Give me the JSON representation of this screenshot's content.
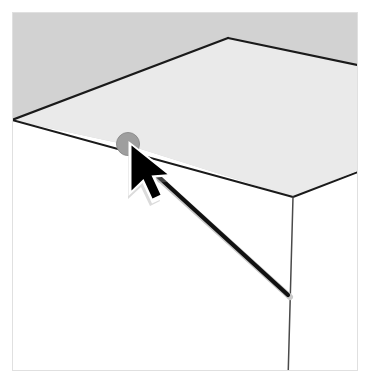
{
  "caption": {
    "text": "the second line",
    "note": "clipped at top edge of image"
  },
  "canvas": {
    "width": 370,
    "height": 383,
    "background": "#ffffff",
    "border_color": "#e3e3e3",
    "border_inset": 12
  },
  "palette": {
    "background_gray": "#d2d2d2",
    "plane_light": "#e9e9e9",
    "line_dark": "#1a1a1a",
    "marker_gray": "#9e9e9e",
    "marker_gray_dark": "#8a8a8a",
    "cursor_black": "#000000",
    "cursor_outline": "#ffffff",
    "cursor_shadow": "#bdbdbd",
    "thin_line": "#3c3c3c"
  },
  "geometry": {
    "background_band": {
      "label": "upper gray background band",
      "points": "12,20 358,20 358,170 293,197 128,145 12,120"
    },
    "ceiling_plane": {
      "label": "ceiling plane",
      "points": "12,120 228,38 358,65 358,170 293,197 128,145"
    },
    "ridge_apex": {
      "x": 228,
      "y": 38
    },
    "ridge_left_end": {
      "x": 12,
      "y": 120
    },
    "ridge_right_end": {
      "x": 358,
      "y": 65
    },
    "corner_vertex": {
      "x": 293,
      "y": 197
    },
    "lower_edge_left": {
      "x": 12,
      "y": 120
    },
    "lower_edge_right": {
      "x": 370,
      "y": 170
    },
    "wall_line_bottom": {
      "x": 288,
      "y": 378
    },
    "thick_line_start": {
      "x": 139,
      "y": 159
    },
    "thick_line_end": {
      "x": 288,
      "y": 295
    },
    "marker_dot": {
      "cx": 128,
      "cy": 144,
      "r": 11
    },
    "cursor_tip": {
      "x": 131,
      "y": 144
    }
  },
  "labels": {
    "marker_dot": "snap-point-marker",
    "cursor": "mouse-pointer",
    "thick_line": "second-line-segment",
    "wall_line": "wall-corner-edge",
    "ceiling_edge": "ceiling-lower-edge",
    "ridge_left": "ceiling-ridge-left",
    "ridge_right": "ceiling-ridge-right"
  }
}
